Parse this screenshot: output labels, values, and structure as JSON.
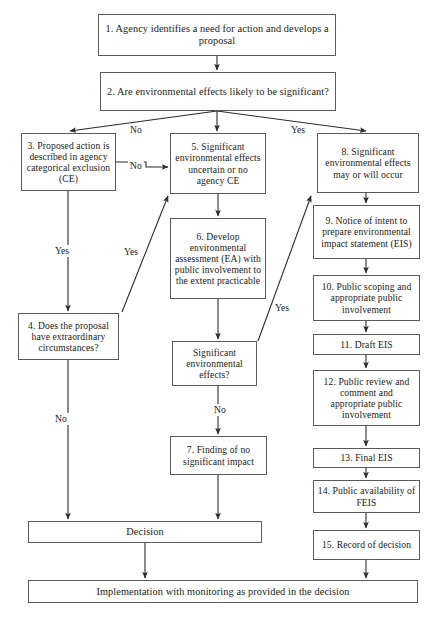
{
  "diagram": {
    "stroke_color": "#5a5a5a",
    "background_color": "#ffffff",
    "text_color": "#1a1a1a"
  },
  "nodes": {
    "n1": "1. Agency identifies a need for action and develops a proposal",
    "n2": "2. Are environmental effects likely to be significant?",
    "n3": "3. Proposed action is described in agency categorical exclusion (CE)",
    "n4": "4. Does the proposal have extraordinary circumstances?",
    "n5": "5. Significant environmental effects uncertain or no agency CE",
    "n6": "6. Develop environmental assessment (EA) with public involvement to the extent practicable",
    "nSig": "Significant environmental effects?",
    "n7": "7. Finding of no significant impact",
    "n8": "8. Significant environmental effects may or will occur",
    "n9": "9. Notice of intent to prepare environmental impact statement (EIS)",
    "n10": "10. Public scoping and appropriate public involvement",
    "n11": "11. Draft EIS",
    "n12": "12. Public review and comment and appropriate public involvement",
    "n13": "13. Final EIS",
    "n14": "14. Public availability of FEIS",
    "n15": "15. Record of decision",
    "nDec": "Decision",
    "nImp": "Implementation with monitoring as provided in the decision"
  },
  "edge_labels": {
    "no_left": "No",
    "yes_top": "Yes",
    "no_ce": "No",
    "yes_left": "Yes",
    "yes_diag": "Yes",
    "no_left2": "No",
    "yes_mid": "Yes",
    "no_mid": "No"
  }
}
